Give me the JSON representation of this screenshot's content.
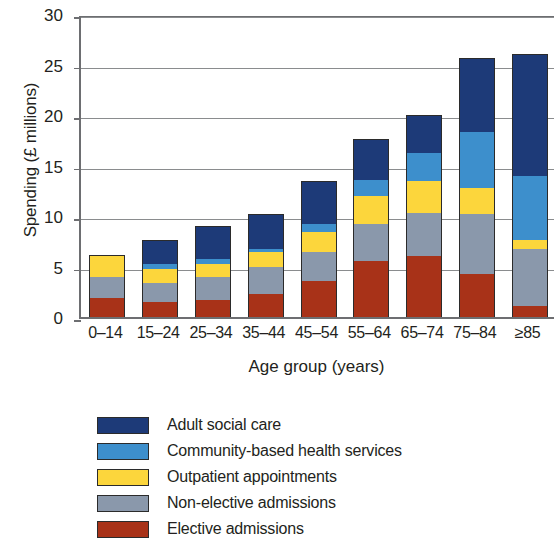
{
  "chart_data": {
    "type": "bar",
    "stacked": true,
    "title": "",
    "xlabel": "Age group (years)",
    "ylabel": "Spending (£ millions)",
    "categories": [
      "0–14",
      "15–24",
      "25–34",
      "35–44",
      "45–54",
      "55–64",
      "65–74",
      "75–84",
      "≥85"
    ],
    "ylim": [
      0,
      30
    ],
    "yticks": [
      0,
      5,
      10,
      15,
      20,
      25,
      30
    ],
    "ytick_labels": [
      "0",
      "5",
      "10",
      "15",
      "20",
      "25",
      "30"
    ],
    "grid": true,
    "grid_axis": "y",
    "legend_position": "below-plot",
    "series": [
      {
        "name": "Elective admissions",
        "color": "#a83218",
        "values": [
          1.9,
          1.5,
          1.7,
          2.3,
          3.6,
          5.5,
          6.0,
          4.3,
          1.1
        ]
      },
      {
        "name": "Non-elective admissions",
        "color": "#8a98ab",
        "values": [
          2.1,
          1.9,
          2.3,
          2.7,
          2.8,
          3.7,
          4.3,
          5.9,
          5.6
        ]
      },
      {
        "name": "Outpatient appointments",
        "color": "#fcd63c",
        "values": [
          2.1,
          1.4,
          1.3,
          1.4,
          2.0,
          2.8,
          3.2,
          2.6,
          0.9
        ]
      },
      {
        "name": "Community-based health services",
        "color": "#3d8fcc",
        "values": [
          0.0,
          0.5,
          0.4,
          0.3,
          0.8,
          1.6,
          2.7,
          5.5,
          6.4
        ]
      },
      {
        "name": "Adult social care",
        "color": "#1d3a78",
        "values": [
          0.0,
          2.3,
          3.3,
          3.5,
          4.3,
          4.0,
          3.8,
          7.3,
          12.0
        ]
      }
    ],
    "totals": [
      6.1,
      7.6,
      9.0,
      10.2,
      13.5,
      17.6,
      20.0,
      25.6,
      26.0
    ]
  },
  "axis": {
    "y_title": "Spending (£ millions)",
    "x_title": "Age group (years)"
  },
  "legend": {
    "items": [
      {
        "label": "Adult social care",
        "color": "#1d3a78"
      },
      {
        "label": "Community-based health services",
        "color": "#3d8fcc"
      },
      {
        "label": "Outpatient appointments",
        "color": "#fcd63c"
      },
      {
        "label": "Non-elective admissions",
        "color": "#8a98ab"
      },
      {
        "label": "Elective admissions",
        "color": "#a83218"
      }
    ]
  }
}
